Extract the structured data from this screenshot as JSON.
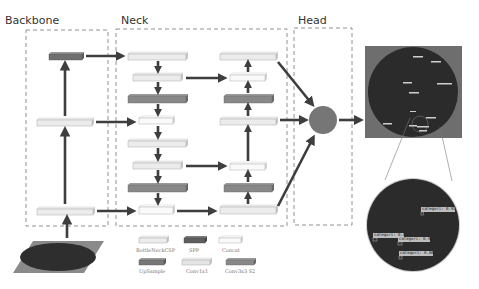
{
  "sections": {
    "backbone": {
      "title": "Backbone"
    },
    "neck": {
      "title": "Neck"
    },
    "head": {
      "title": "Head"
    }
  },
  "colors": {
    "light_block": "#ececec",
    "light_block_side": "#c8c8c8",
    "dark_block": "#7a7a7a",
    "dark_block_side": "#5a5a5a",
    "white_block": "#fafafa",
    "arrow": "#3e3e3e",
    "dashed_border": "#777777",
    "head_circle": "#767676",
    "image_bg": "#6e6e6e",
    "image_dark": "#2c2c2c"
  },
  "legend": {
    "items": [
      {
        "label": "BottleNeckCSP",
        "type": "bottleneck_csp"
      },
      {
        "label": "SPP",
        "type": "spp"
      },
      {
        "label": "Concat",
        "type": "concat"
      },
      {
        "label": "UpSample",
        "type": "upsample"
      },
      {
        "label": "Conv1x1",
        "type": "conv1x1"
      },
      {
        "label": "Conv3x3 S2",
        "type": "conv3x3_s2"
      }
    ]
  },
  "detections": {
    "zoomed": [
      {
        "label": "categori: 0.92"
      },
      {
        "label": "categori: 0.82"
      },
      {
        "label": "categori: 0.92"
      },
      {
        "label": "categori: 0.86"
      }
    ]
  }
}
